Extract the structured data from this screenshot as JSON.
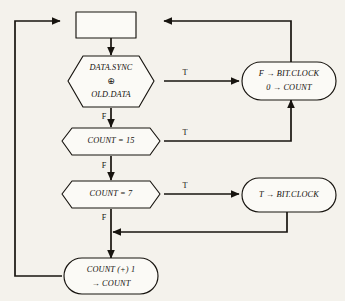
{
  "diagram": {
    "background_color": "#f4f2ec",
    "line_color": "#17140f",
    "shape_fill": "#fbfaf6"
  },
  "nodes": {
    "start_box": {
      "type": "rectangle",
      "label": ""
    },
    "data_sync_decision": {
      "type": "hexagon-decision",
      "line1": "DATA.SYNC",
      "operator": "⊕",
      "line2": "OLD.DATA"
    },
    "count_eq_15_decision": {
      "type": "hexagon-decision",
      "label": "COUNT = 15"
    },
    "count_eq_7_decision": {
      "type": "hexagon-decision",
      "label": "COUNT = 7"
    },
    "reset_clock_process": {
      "type": "stadium-process",
      "line1": "F → BIT.CLOCK",
      "line2": "0 → COUNT"
    },
    "set_clock_process": {
      "type": "stadium-process",
      "label": "T → BIT.CLOCK"
    },
    "increment_count_process": {
      "type": "stadium-process",
      "line1": "COUNT (+) 1",
      "line2": "→ COUNT"
    }
  },
  "edge_labels": {
    "sync_true": "T",
    "sync_false": "F",
    "count15_true": "T",
    "count15_false": "F",
    "count7_true": "T",
    "count7_false": "F"
  }
}
